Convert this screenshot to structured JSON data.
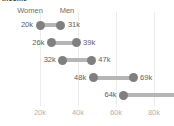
{
  "chart_data": {
    "type": "bar",
    "subtype": "dumbbell-range",
    "title": "Income",
    "xlabel": "",
    "ylabel": "",
    "grid": true,
    "legend_position": "top-inline",
    "xlim": [
      8000,
      90000
    ],
    "xticks": [
      20000,
      40000,
      60000,
      80000
    ],
    "xticklabels": [
      "20k",
      "40k",
      "60k",
      "80k"
    ],
    "categories": [
      "row-1",
      "row-2",
      "row-3",
      "row-4",
      "row-5"
    ],
    "series": [
      {
        "name": "Women",
        "values": [
          20000,
          26000,
          32000,
          48000,
          64000
        ]
      },
      {
        "name": "Men",
        "values": [
          31000,
          39000,
          47000,
          69000,
          null
        ]
      }
    ],
    "rows": [
      {
        "left_label": "20k",
        "right_label": "31k",
        "left": 20000,
        "right": 31000,
        "right_clipped": false
      },
      {
        "left_label": "26k",
        "right_label": "39k",
        "left": 26000,
        "right": 39000,
        "right_clipped": false
      },
      {
        "left_label": "32k",
        "right_label": "47k",
        "left": 32000,
        "right": 47000,
        "right_clipped": false
      },
      {
        "left_label": "48k",
        "right_label": "69k",
        "left": 48000,
        "right": 69000,
        "right_clipped": false
      },
      {
        "left_label": "64k",
        "right_label": "",
        "left": 64000,
        "right": 92000,
        "right_clipped": true
      }
    ],
    "colors": {
      "dot": "#808080",
      "bar": "#b6b6b6",
      "value_label": "#5e5e5e",
      "header_label": "#6d6d6d",
      "tick_label": "#b3b3b3",
      "gridline": "#ececec",
      "background": "#ffffff"
    }
  },
  "headers": {
    "women": "Women",
    "men": "Men",
    "women_x": 30,
    "men_x": 67
  }
}
